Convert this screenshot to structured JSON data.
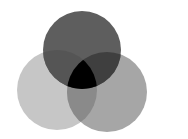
{
  "diagram": {
    "type": "venn",
    "sets": 3,
    "background": "#ffffff",
    "circles": [
      {
        "id": "top",
        "cx": 82,
        "cy": 50,
        "r": 39,
        "color": "#5e5e5e"
      },
      {
        "id": "left",
        "cx": 57,
        "cy": 90,
        "r": 40,
        "color": "#c6c6c6"
      },
      {
        "id": "right",
        "cx": 107,
        "cy": 92,
        "r": 40,
        "color": "#a6a6a6"
      }
    ],
    "overlaps": {
      "top_left": "#555555",
      "top_right": "#3f3f3f",
      "left_right": "#8a8a8a",
      "all_three": "#000000"
    }
  }
}
